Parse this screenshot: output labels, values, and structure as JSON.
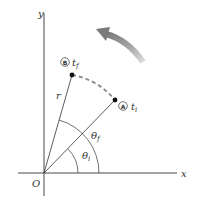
{
  "diagram": {
    "axes": {
      "x_label": "x",
      "y_label": "y",
      "origin_label": "O"
    },
    "points": [
      {
        "id": "A",
        "marker": "A",
        "time_label": "t",
        "time_sub": "i"
      },
      {
        "id": "B",
        "marker": "B",
        "time_label": "t",
        "time_sub": "f"
      }
    ],
    "radius_label": "r",
    "angles": [
      {
        "id": "theta_i",
        "symbol": "θ",
        "sub": "i"
      },
      {
        "id": "theta_f",
        "symbol": "θ",
        "sub": "f"
      }
    ],
    "rotation_arrow": {
      "direction": "counterclockwise",
      "color": "#8a8a8a"
    },
    "path_color": "#8f8f8f",
    "line_color": "#333333"
  }
}
